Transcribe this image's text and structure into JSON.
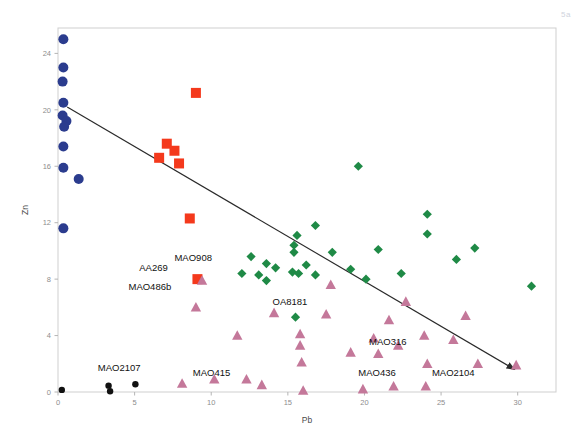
{
  "figure": {
    "tag": "5a",
    "background": "#ffffff",
    "frame_color": "#cfcfcf"
  },
  "chart_data": {
    "type": "scatter",
    "title": "",
    "xlabel": "Pb",
    "ylabel": "Zn",
    "xlim": [
      0,
      32.5
    ],
    "ylim": [
      0,
      25.8
    ],
    "xticks": [
      0,
      5,
      10,
      15,
      20,
      25,
      30
    ],
    "yticks": [
      0,
      4,
      8,
      12,
      16,
      20,
      24
    ],
    "xtick_labels": [
      "0",
      "5",
      "10",
      "15",
      "20",
      "25",
      "30"
    ],
    "ytick_labels": [
      "0",
      "4",
      "8",
      "12",
      "16",
      "20",
      "24"
    ],
    "grid": false,
    "legend": "none",
    "series": [
      {
        "name": "blue-circles",
        "marker": "circle",
        "color": "#2b3c8e",
        "points": [
          [
            0.35,
            25.0
          ],
          [
            0.35,
            23.0
          ],
          [
            0.3,
            22.0
          ],
          [
            0.35,
            20.5
          ],
          [
            0.3,
            19.6
          ],
          [
            0.55,
            19.2
          ],
          [
            0.4,
            18.8
          ],
          [
            0.35,
            17.4
          ],
          [
            0.35,
            15.9
          ],
          [
            1.35,
            15.1
          ],
          [
            0.35,
            11.6
          ]
        ]
      },
      {
        "name": "red-squares",
        "marker": "square",
        "color": "#f4391c",
        "points": [
          [
            9.0,
            21.2
          ],
          [
            7.1,
            17.6
          ],
          [
            7.6,
            17.1
          ],
          [
            6.6,
            16.6
          ],
          [
            7.9,
            16.2
          ],
          [
            8.6,
            12.3
          ],
          [
            9.1,
            8.0
          ]
        ]
      },
      {
        "name": "green-diamonds",
        "marker": "diamond",
        "color": "#1f8a46",
        "points": [
          [
            19.6,
            16.0
          ],
          [
            24.1,
            12.6
          ],
          [
            16.8,
            11.8
          ],
          [
            24.1,
            11.2
          ],
          [
            15.6,
            11.1
          ],
          [
            15.4,
            10.4
          ],
          [
            20.9,
            10.1
          ],
          [
            15.4,
            9.9
          ],
          [
            27.2,
            10.2
          ],
          [
            12.6,
            9.6
          ],
          [
            17.9,
            9.9
          ],
          [
            13.6,
            9.1
          ],
          [
            26.0,
            9.4
          ],
          [
            16.2,
            9.0
          ],
          [
            14.2,
            8.8
          ],
          [
            19.1,
            8.7
          ],
          [
            12.0,
            8.4
          ],
          [
            13.1,
            8.3
          ],
          [
            22.4,
            8.4
          ],
          [
            15.3,
            8.5
          ],
          [
            15.7,
            8.4
          ],
          [
            16.8,
            8.3
          ],
          [
            13.6,
            7.9
          ],
          [
            20.1,
            8.0
          ],
          [
            30.9,
            7.5
          ],
          [
            15.5,
            5.3
          ]
        ]
      },
      {
        "name": "pink-triangles",
        "marker": "triangle",
        "color": "#c4789a",
        "points": [
          [
            9.4,
            7.9
          ],
          [
            17.8,
            7.6
          ],
          [
            9.0,
            6.0
          ],
          [
            22.7,
            6.4
          ],
          [
            14.1,
            5.6
          ],
          [
            17.5,
            5.5
          ],
          [
            26.6,
            5.4
          ],
          [
            21.6,
            5.1
          ],
          [
            11.7,
            4.0
          ],
          [
            15.8,
            4.1
          ],
          [
            23.9,
            4.0
          ],
          [
            20.6,
            3.8
          ],
          [
            25.8,
            3.7
          ],
          [
            22.2,
            3.3
          ],
          [
            15.8,
            3.3
          ],
          [
            19.1,
            2.8
          ],
          [
            20.9,
            2.7
          ],
          [
            15.9,
            2.1
          ],
          [
            24.1,
            2.0
          ],
          [
            27.4,
            2.0
          ],
          [
            29.9,
            1.9
          ],
          [
            8.1,
            0.6
          ],
          [
            10.2,
            0.9
          ],
          [
            12.3,
            0.9
          ],
          [
            13.3,
            0.5
          ],
          [
            21.9,
            0.4
          ],
          [
            24.0,
            0.4
          ],
          [
            16.0,
            0.1
          ],
          [
            19.9,
            0.2
          ]
        ]
      },
      {
        "name": "black-circles",
        "marker": "circle",
        "color": "#111111",
        "points": [
          [
            0.25,
            0.15
          ],
          [
            3.3,
            0.45
          ],
          [
            3.4,
            0.05
          ],
          [
            5.05,
            0.55
          ]
        ]
      }
    ],
    "trendline": {
      "x0": 0.6,
      "y0": 20.2,
      "x1": 29.8,
      "y1": 1.6,
      "arrow": true,
      "color": "#2a2a2a"
    },
    "annotations": [
      {
        "text": "MAO908",
        "x": 7.6,
        "y": 9.3
      },
      {
        "text": "AA269",
        "x": 5.3,
        "y": 8.6
      },
      {
        "text": "MAO486b",
        "x": 4.6,
        "y": 7.2
      },
      {
        "text": "OA8181",
        "x": 14.0,
        "y": 6.2
      },
      {
        "text": "MAO2107",
        "x": 2.6,
        "y": 1.5
      },
      {
        "text": "MAO415",
        "x": 8.8,
        "y": 1.1
      },
      {
        "text": "MAO316",
        "x": 20.3,
        "y": 3.3
      },
      {
        "text": "MAO436",
        "x": 19.6,
        "y": 1.1
      },
      {
        "text": "MAO2104",
        "x": 24.4,
        "y": 1.1
      }
    ]
  }
}
